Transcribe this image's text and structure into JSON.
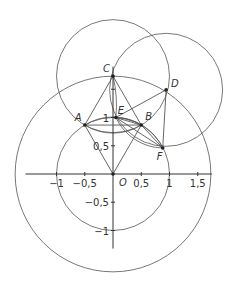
{
  "diagram": {
    "origin_px": [
      113,
      174
    ],
    "unit_px": 56.5,
    "stroke_color": "#555555",
    "point_color": "#222222",
    "axes": {
      "x_range": [
        -1.55,
        1.75
      ],
      "y_range": [
        -1.32,
        1.9
      ],
      "x_ticks": [
        {
          "value": -1,
          "label": "−1"
        },
        {
          "value": -0.5,
          "label": "−0,5"
        },
        {
          "value": 0.5,
          "label": "0,5"
        },
        {
          "value": 1,
          "label": "1"
        },
        {
          "value": 1.5,
          "label": "1,5"
        }
      ],
      "y_ticks": [
        {
          "value": 1.5,
          "label": ""
        },
        {
          "value": 1,
          "label": "1"
        },
        {
          "value": 0.5,
          "label": "0,5"
        },
        {
          "value": -0.5,
          "label": "−0,5"
        },
        {
          "value": -1,
          "label": "−1"
        }
      ]
    },
    "points": [
      {
        "name": "O",
        "x": 0,
        "y": 0
      },
      {
        "name": "A",
        "x": -0.5,
        "y": 0.866
      },
      {
        "name": "B",
        "x": 0.5,
        "y": 0.866
      },
      {
        "name": "C",
        "x": 0,
        "y": 1.732
      },
      {
        "name": "D",
        "x": 0.94,
        "y": 1.49
      },
      {
        "name": "E",
        "x": 0.05,
        "y": 1.0
      },
      {
        "name": "F",
        "x": 0.88,
        "y": 0.46
      }
    ],
    "circles": [
      {
        "center": "O",
        "r": 1
      },
      {
        "center": "O",
        "r": 1.732
      },
      {
        "center": "C",
        "r": 1
      },
      {
        "center": "D",
        "r": 1
      }
    ],
    "segments": [
      [
        "C",
        "A"
      ],
      [
        "C",
        "B"
      ],
      [
        "A",
        "B"
      ],
      [
        "O",
        "A"
      ],
      [
        "O",
        "B"
      ],
      [
        "E",
        "D"
      ],
      [
        "D",
        "F"
      ],
      [
        "E",
        "F"
      ],
      [
        "E",
        "B"
      ],
      [
        "B",
        "F"
      ]
    ]
  }
}
